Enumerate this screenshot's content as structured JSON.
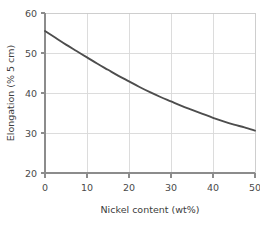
{
  "chart_data": {
    "type": "line",
    "title": "",
    "xlabel": "Nickel content (wt%)",
    "ylabel": "Elongation (% 5 cm)",
    "xlim": [
      0,
      50
    ],
    "ylim": [
      20,
      60
    ],
    "xticks": [
      0,
      10,
      20,
      30,
      40,
      50
    ],
    "yticks": [
      20,
      30,
      40,
      50,
      60
    ],
    "xtick_labels": [
      "0",
      "10",
      "20",
      "30",
      "40",
      "50"
    ],
    "ytick_labels": [
      "20",
      "30",
      "40",
      "50",
      "60"
    ],
    "grid": true,
    "legend": null,
    "series": [
      {
        "name": "Elongation",
        "color": "#4d4d4d",
        "x": [
          0,
          2.5,
          5,
          7.5,
          10,
          12.5,
          15,
          17.5,
          20,
          22.5,
          25,
          27.5,
          30,
          32.5,
          35,
          37.5,
          40,
          42.5,
          45,
          47.5,
          50
        ],
        "values": [
          55.5,
          53.8,
          52.1,
          50.5,
          48.9,
          47.3,
          45.8,
          44.3,
          42.9,
          41.5,
          40.2,
          39.0,
          37.9,
          36.8,
          35.8,
          34.8,
          33.8,
          32.9,
          32.1,
          31.4,
          30.6
        ]
      }
    ],
    "colors": {
      "curve": "#4d4d4d",
      "grid": "#d8d8d8",
      "axis": "#8c8c8c",
      "background": "#ffffff",
      "text": "#4a4a4a"
    }
  }
}
